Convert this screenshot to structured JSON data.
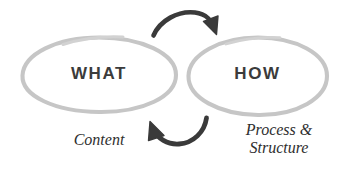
{
  "diagram": {
    "background_color": "#ffffff",
    "nodes": [
      {
        "id": "what",
        "label": "WHAT",
        "caption": "Content",
        "shape": "hand-drawn-ellipse",
        "stroke_color": "#c6c6c6",
        "text_color": "#3b3b3b"
      },
      {
        "id": "how",
        "label": "HOW",
        "caption_line_1": "Process &",
        "caption_line_2": "Structure",
        "shape": "hand-drawn-ellipse",
        "stroke_color": "#c6c6c6",
        "text_color": "#3b3b3b"
      }
    ],
    "arrows": [
      {
        "id": "arrow-top",
        "from": "what",
        "to": "how",
        "direction": "left-to-right",
        "position": "top",
        "color": "#3a3a3a"
      },
      {
        "id": "arrow-bottom",
        "from": "how",
        "to": "what",
        "direction": "right-to-left",
        "position": "bottom",
        "color": "#3a3a3a"
      }
    ]
  }
}
